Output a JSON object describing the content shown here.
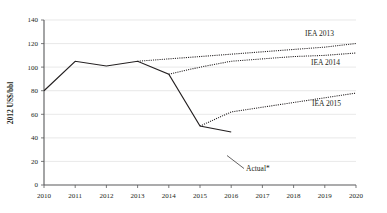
{
  "chart_data": {
    "type": "line",
    "title": "",
    "subtitle": "",
    "xlabel": "",
    "ylabel": "2012 US$/bbl",
    "xlim": [
      2010,
      2020
    ],
    "ylim": [
      0,
      140
    ],
    "grid": true,
    "legend_position": "inline-right-end-labels",
    "x": [
      2010,
      2011,
      2012,
      2013,
      2014,
      2015,
      2016,
      2017,
      2018,
      2019,
      2020
    ],
    "xtick_labels": [
      "2010",
      "2011",
      "2012",
      "2013",
      "2014",
      "2015",
      "2016",
      "2017",
      "2018",
      "2019",
      "2020"
    ],
    "ytick_labels": [
      "0",
      "20",
      "40",
      "60",
      "80",
      "100",
      "120",
      "140"
    ],
    "ytick_values": [
      0,
      20,
      40,
      60,
      80,
      100,
      120,
      140
    ],
    "series": [
      {
        "name": "Actual*",
        "style": "solid",
        "x": [
          2010,
          2011,
          2012,
          2013,
          2014,
          2015,
          2016
        ],
        "values": [
          80,
          105,
          101,
          105,
          94,
          50,
          45
        ]
      },
      {
        "name": "IEA 2013",
        "style": "dotted",
        "x": [
          2013,
          2014,
          2015,
          2016,
          2017,
          2018,
          2019,
          2020
        ],
        "values": [
          105,
          107,
          109,
          111,
          113,
          115,
          117,
          120
        ]
      },
      {
        "name": "IEA 2014",
        "style": "dotted",
        "x": [
          2014,
          2015,
          2016,
          2017,
          2018,
          2019,
          2020
        ],
        "values": [
          94,
          100,
          105,
          107,
          109,
          110,
          112
        ]
      },
      {
        "name": "IEA 2015",
        "style": "dotted",
        "x": [
          2015,
          2016,
          2017,
          2018,
          2019,
          2020
        ],
        "values": [
          50,
          62,
          66,
          70,
          74,
          78
        ]
      }
    ],
    "annotations": [
      {
        "text": "Actual*",
        "target_x": 2016,
        "target_y": 45
      },
      {
        "text": "IEA 2013",
        "target_x": 2020,
        "target_y": 120
      },
      {
        "text": "IEA 2014",
        "target_x": 2020,
        "target_y": 112
      },
      {
        "text": "IEA 2015",
        "target_x": 2020,
        "target_y": 78
      }
    ]
  },
  "labels": {
    "y_axis_title": "2012 US$/bbl",
    "y_140": "140",
    "y_120": "120",
    "y_100": "100",
    "y_80": "80",
    "y_60": "60",
    "y_40": "40",
    "y_20": "20",
    "y_0": "0",
    "x_2010": "2010",
    "x_2011": "2011",
    "x_2012": "2012",
    "x_2013": "2013",
    "x_2014": "2014",
    "x_2015": "2015",
    "x_2016": "2016",
    "x_2017": "2017",
    "x_2018": "2018",
    "x_2019": "2019",
    "x_2020": "2020",
    "series_actual": "Actual*",
    "series_iea_2013": "IEA 2013",
    "series_iea_2014": "IEA 2014",
    "series_iea_2015": "IEA 2015"
  },
  "colors": {
    "line": "#231f20",
    "gridline": "#d9d9d9",
    "axis": "#58595b",
    "background": "#ffffff"
  }
}
